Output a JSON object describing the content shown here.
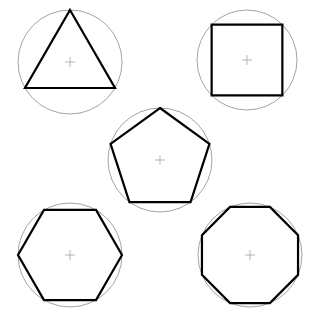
{
  "canvas": {
    "width": 310,
    "height": 321,
    "background_color": "#ffffff"
  },
  "style": {
    "circle_stroke_color": "#8c8c8c",
    "circle_stroke_width": 0.8,
    "polygon_stroke_color": "#000000",
    "polygon_stroke_width": 2.2,
    "crosshair_color": "#b5b5b5",
    "crosshair_stroke_width": 1.0,
    "crosshair_arm_length": 5
  },
  "chart_data": {
    "type": "diagram",
    "title": "",
    "subtitle": "",
    "xlabel": "",
    "ylabel": "",
    "legend": [],
    "annotations": [],
    "figures": [
      {
        "name": "triangle",
        "sides": 3,
        "label": "equilateral-triangle",
        "center_x": 70,
        "center_y": 62,
        "radius": 52,
        "rotation_deg": -90,
        "row": 1,
        "column": 1
      },
      {
        "name": "square",
        "sides": 4,
        "label": "square",
        "center_x": 247,
        "center_y": 60,
        "radius": 50,
        "rotation_deg": -135,
        "row": 1,
        "column": 2
      },
      {
        "name": "pentagon",
        "sides": 5,
        "label": "regular-pentagon",
        "center_x": 160,
        "center_y": 160,
        "radius": 52,
        "rotation_deg": -90,
        "row": 2,
        "column": 1
      },
      {
        "name": "hexagon",
        "sides": 6,
        "label": "regular-hexagon",
        "center_x": 70,
        "center_y": 255,
        "radius": 52,
        "rotation_deg": 0,
        "row": 3,
        "column": 1
      },
      {
        "name": "octagon",
        "sides": 8,
        "label": "regular-octagon",
        "center_x": 250,
        "center_y": 255,
        "radius": 52,
        "rotation_deg": 22.5,
        "row": 3,
        "column": 2
      }
    ]
  }
}
